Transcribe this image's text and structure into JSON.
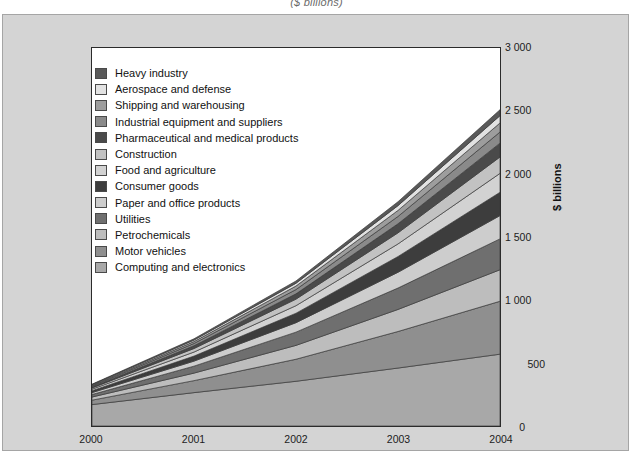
{
  "figure": {
    "title": "($ billions)",
    "ylabel": "$ billions"
  },
  "axes": {
    "y_ticks": [
      "0",
      "500",
      "1 000",
      "1 500",
      "2 000",
      "2 500",
      "3 000"
    ],
    "x_ticks": [
      "2000",
      "2001",
      "2002",
      "2003",
      "2004"
    ]
  },
  "legend": {
    "items": [
      {
        "label": "Heavy industry",
        "color": "#595959"
      },
      {
        "label": "Aerospace and defense",
        "color": "#e2e2e2"
      },
      {
        "label": "Shipping and warehousing",
        "color": "#9d9d9d"
      },
      {
        "label": "Industrial equipment and suppliers",
        "color": "#8a8a8a"
      },
      {
        "label": "Pharmaceutical and medical products",
        "color": "#4a4a4a"
      },
      {
        "label": "Construction",
        "color": "#c2c2c2"
      },
      {
        "label": "Food and agriculture",
        "color": "#d2d2d2"
      },
      {
        "label": "Consumer goods",
        "color": "#3d3d3d"
      },
      {
        "label": "Paper and office products",
        "color": "#cdcdcd"
      },
      {
        "label": "Utilities",
        "color": "#6f6f6f"
      },
      {
        "label": "Petrochemicals",
        "color": "#bdbdbd"
      },
      {
        "label": "Motor vehicles",
        "color": "#8f8f8f"
      },
      {
        "label": "Computing and electronics",
        "color": "#a8a8a8"
      }
    ]
  },
  "chart_data": {
    "type": "area",
    "title": "($ billions)",
    "xlabel": "",
    "ylabel": "$ billions",
    "ylim": [
      0,
      3000
    ],
    "grid": false,
    "legend_position": "inside-top-left",
    "stacking": "stacked",
    "categories": [
      "2000",
      "2001",
      "2002",
      "2003",
      "2004"
    ],
    "series": [
      {
        "name": "Computing and electronics",
        "color": "#a8a8a8",
        "values": [
          170,
          265,
          355,
          460,
          570
        ]
      },
      {
        "name": "Motor vehicles",
        "color": "#8f8f8f",
        "values": [
          35,
          95,
          175,
          290,
          420
        ]
      },
      {
        "name": "Petrochemicals",
        "color": "#bdbdbd",
        "values": [
          25,
          60,
          110,
          175,
          250
        ]
      },
      {
        "name": "Utilities",
        "color": "#6f6f6f",
        "values": [
          20,
          55,
          105,
          170,
          245
        ]
      },
      {
        "name": "Paper and office products",
        "color": "#cdcdcd",
        "values": [
          15,
          40,
          75,
          125,
          185
        ]
      },
      {
        "name": "Consumer goods",
        "color": "#3d3d3d",
        "values": [
          15,
          40,
          75,
          125,
          185
        ]
      },
      {
        "name": "Food and agriculture",
        "color": "#d2d2d2",
        "values": [
          12,
          32,
          60,
          100,
          150
        ]
      },
      {
        "name": "Construction",
        "color": "#c2c2c2",
        "values": [
          10,
          28,
          52,
          88,
          130
        ]
      },
      {
        "name": "Pharmaceutical and medical products",
        "color": "#4a4a4a",
        "values": [
          8,
          22,
          42,
          72,
          110
        ]
      },
      {
        "name": "Industrial equipment and suppliers",
        "color": "#8a8a8a",
        "values": [
          7,
          18,
          34,
          58,
          88
        ]
      },
      {
        "name": "Shipping and warehousing",
        "color": "#9d9d9d",
        "values": [
          6,
          15,
          28,
          48,
          72
        ]
      },
      {
        "name": "Aerospace and defense",
        "color": "#e2e2e2",
        "values": [
          5,
          12,
          22,
          38,
          58
        ]
      },
      {
        "name": "Heavy industry",
        "color": "#595959",
        "values": [
          4,
          10,
          18,
          31,
          47
        ]
      }
    ],
    "totals": [
      332,
      692,
      1151,
      1780,
      2510
    ]
  }
}
